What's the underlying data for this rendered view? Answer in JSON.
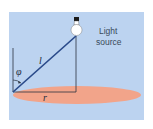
{
  "diagram": {
    "labels": {
      "source_line1": "Light",
      "source_line2": "source",
      "angle": "φ",
      "hypotenuse": "l",
      "radius": "r"
    },
    "colors": {
      "background": "#bcd3f0",
      "surface": "#f2a48a",
      "lines": "#2a4a8a",
      "frame": "#2b3440",
      "bulb": "#ffffff",
      "bulb_cap": "#1a1a1a"
    }
  }
}
